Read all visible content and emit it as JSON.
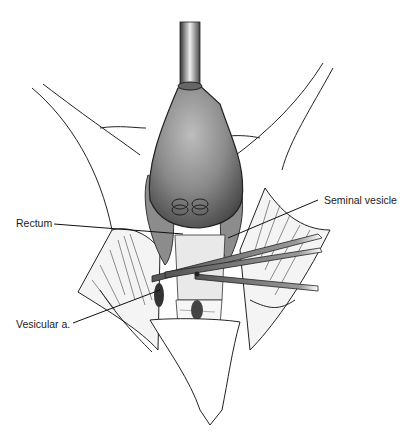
{
  "figure": {
    "labels": {
      "rectum": "Rectum",
      "seminal_vesicle": "Seminal vesicle",
      "vesicular_artery": "Vesicular a."
    }
  }
}
